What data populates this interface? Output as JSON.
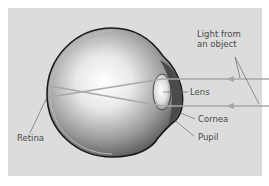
{
  "diagram": {
    "labels": {
      "light_line1": "Light from",
      "light_line2": "an object",
      "lens": "Lens",
      "cornea": "Cornea",
      "pupil": "Pupil",
      "retina": "Retina"
    },
    "colors": {
      "background": "#dcdcdc",
      "eyeball_light": "#ffffff",
      "eyeball_dark": "#6e6e6e",
      "outline": "#1a1a1a",
      "light_ray": "#a8a8a8",
      "iris": "#4a4a4a",
      "label_text": "#4a4a4a"
    }
  }
}
